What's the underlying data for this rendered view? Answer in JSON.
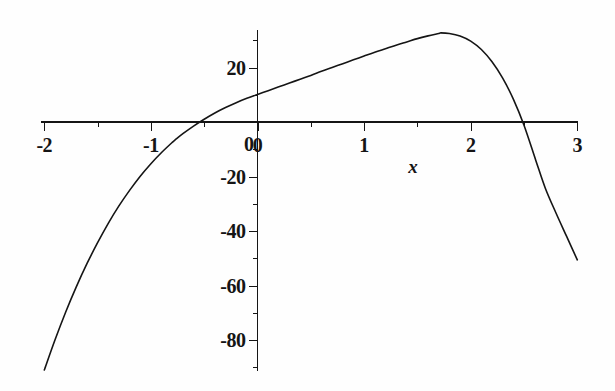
{
  "figure": {
    "kind": "cartesian-plot",
    "background_color": "#fefefe",
    "ink_color": "#151515"
  },
  "axes": {
    "x_axis_label": "x",
    "y_axis_label": "",
    "x_ticks_major": [
      "-2",
      "-1",
      "0",
      "1",
      "2",
      "3"
    ],
    "y_ticks_major": [
      "20",
      "0",
      "-20",
      "-40",
      "-60",
      "-80"
    ]
  },
  "chart_data": {
    "type": "line",
    "title": "",
    "xlabel": "x",
    "ylabel": "",
    "xlim": [
      -2,
      3
    ],
    "ylim": [
      -92,
      35
    ],
    "grid": false,
    "legend": false,
    "legend_position": "none",
    "x_tick_values": [
      -2,
      -1,
      0,
      1,
      2,
      3
    ],
    "x_tick_labels": [
      "-2",
      "-1",
      "0",
      "1",
      "2",
      "3"
    ],
    "y_tick_values": [
      20,
      0,
      -20,
      -40,
      -60,
      -80
    ],
    "y_tick_labels": [
      "20",
      "0",
      "-20",
      "-40",
      "-60",
      "-80"
    ],
    "y_minor_tick_values": [
      30,
      10,
      -10,
      -30,
      -50,
      -70,
      -90
    ],
    "x_minor_tick_values": [
      -1.5,
      -0.5,
      0.5,
      1.5,
      2.5
    ],
    "annotations": [],
    "series": [
      {
        "name": "curve",
        "color": "#151515",
        "x": [
          -2.0,
          -1.9,
          -1.8,
          -1.7,
          -1.6,
          -1.5,
          -1.4,
          -1.3,
          -1.2,
          -1.1,
          -1.0,
          -0.9,
          -0.8,
          -0.77,
          -0.7,
          -0.6,
          -0.5,
          -0.4,
          -0.3,
          -0.2,
          -0.1,
          0.0,
          0.1,
          0.2,
          0.3,
          0.4,
          0.5,
          0.6,
          0.7,
          0.8,
          0.9,
          1.0,
          1.1,
          1.2,
          1.3,
          1.4,
          1.5,
          1.6,
          1.7,
          1.72,
          1.8,
          1.9,
          2.0,
          2.1,
          2.2,
          2.3,
          2.4,
          2.5,
          2.61,
          2.7,
          2.8,
          2.9,
          3.0
        ],
        "y": [
          -91.0,
          -80.0,
          -69.8,
          -60.5,
          -52.0,
          -44.3,
          -37.2,
          -30.8,
          -25.1,
          -19.9,
          -15.3,
          -11.2,
          -7.5,
          -6.5,
          -4.3,
          -1.5,
          1.0,
          3.3,
          5.3,
          7.1,
          8.7,
          10.1,
          11.5,
          12.9,
          14.3,
          15.7,
          17.1,
          18.6,
          20.0,
          21.4,
          22.8,
          24.2,
          25.6,
          26.9,
          28.2,
          29.4,
          30.6,
          31.6,
          32.5,
          32.7,
          32.5,
          31.6,
          29.7,
          26.6,
          22.1,
          16.1,
          8.4,
          -1.2,
          -14.0,
          -24.3,
          -33.4,
          -42.0,
          -50.6
        ],
        "markers": false,
        "linewidth": 1.6,
        "notable_points": {
          "y_intercept": {
            "x": 0.0,
            "y": 10.1
          },
          "left_root": {
            "x": -0.77,
            "y": 0.0
          },
          "right_root": {
            "x": 2.61,
            "y": 0.0
          },
          "local_maximum": {
            "x": 1.72,
            "y": 32.7
          },
          "left_endpoint": {
            "x": -2.0,
            "y": -91.0
          },
          "right_endpoint": {
            "x": 3.0,
            "y": -50.6
          }
        }
      }
    ]
  }
}
